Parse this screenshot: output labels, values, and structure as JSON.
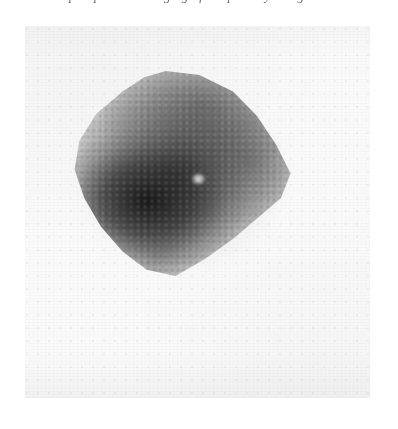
{
  "page": {
    "kind": "medical-scan-figure",
    "background_color": "#ffffff"
  },
  "caption_strip": {
    "note": "line of italic caption text cropped at the top edge; only descenders are visible",
    "text": "preoperative imaging of the parathyroid gland"
  },
  "scan": {
    "modality": "scintigram",
    "film_color": "#fafafa",
    "film_bounds": {
      "x": 25,
      "y": 26,
      "width": 345,
      "height": 372
    },
    "appearance": "grainy speckled greyscale photon-count image on a near-white film"
  },
  "uptake": {
    "label": "radiotracer uptake region",
    "shape": "rounded triangular mass, apex upper-centre, broad base lower-left",
    "bounds": {
      "x": 65,
      "y": 71,
      "width": 240,
      "height": 205
    },
    "hot_focus": {
      "x": 145,
      "y": 198,
      "intensity": "darkest"
    },
    "cold_focus": {
      "x": 172,
      "y": 175,
      "intensity": "bright photopenic spot"
    },
    "darkest_gray": "#121212",
    "mid_gray": "#6e6e6e",
    "film_gray": "#fafafa"
  }
}
